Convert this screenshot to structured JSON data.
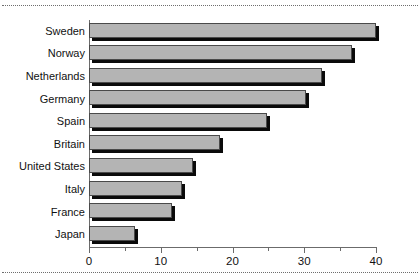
{
  "chart_data": {
    "type": "bar",
    "orientation": "horizontal",
    "title": "",
    "xlabel": "",
    "ylabel": "",
    "xlim": [
      0,
      40
    ],
    "grid": false,
    "legend": false,
    "categories": [
      "Sweden",
      "Norway",
      "Netherlands",
      "Germany",
      "Spain",
      "Britain",
      "United States",
      "Italy",
      "France",
      "Japan"
    ],
    "values": [
      40,
      36.7,
      32.5,
      30.3,
      24.8,
      18.3,
      14.5,
      13,
      11.5,
      6.4
    ],
    "xticks": [
      0,
      10,
      20,
      30,
      40
    ],
    "xtick_labels": [
      "0",
      "10",
      "20",
      "30",
      "40"
    ],
    "xticks_minor": [
      5,
      15,
      25,
      35
    ],
    "bar_fill_color": "#b4b4b4",
    "bar_edge_color": "#4a4a4a",
    "bar_shadow_color": "#0a0a0a",
    "axis_color": "#6b6b6b"
  }
}
